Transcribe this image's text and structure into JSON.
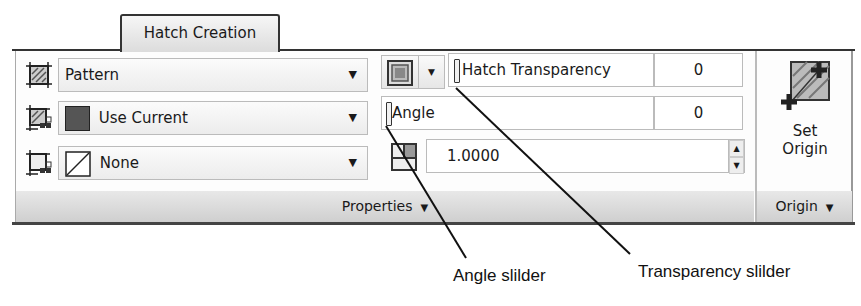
{
  "ribbon": {
    "tab_label": "Hatch Creation"
  },
  "properties": {
    "pattern_dropdown": {
      "value": "Pattern"
    },
    "color_dropdown": {
      "value": "Use Current",
      "swatch_color": "#555555"
    },
    "background_dropdown": {
      "value": "None"
    },
    "transparency": {
      "label": "Hatch Transparency",
      "value": "0"
    },
    "angle": {
      "label": "Angle",
      "value": "0"
    },
    "scale": {
      "value": "1.0000"
    },
    "panel_label": "Properties"
  },
  "origin": {
    "button_label_line1": "Set",
    "button_label_line2": "Origin",
    "panel_label": "Origin"
  },
  "callouts": {
    "angle_slider": "Angle slilder",
    "transparency_slider": "Transparency slilder"
  }
}
